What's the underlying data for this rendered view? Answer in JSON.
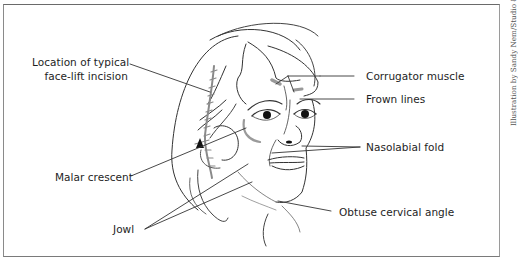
{
  "figure": {
    "type": "labeled medical illustration",
    "credit": "Illustration by Sandy Nem/Studio 8 Graphics"
  },
  "labels": {
    "incision_line1": "Location of typical",
    "incision_line2": "face-lift incision",
    "malar": "Malar crescent",
    "jowl": "Jowl",
    "corrugator": "Corrugator muscle",
    "frown": "Frown lines",
    "nasolabial": "Nasolabial fold",
    "cervical": "Obtuse cervical angle"
  },
  "colors": {
    "line": "#2a2a2a",
    "accent_gray": "#8c8c8c",
    "frame": "#777777",
    "text": "#1e1e1e"
  }
}
